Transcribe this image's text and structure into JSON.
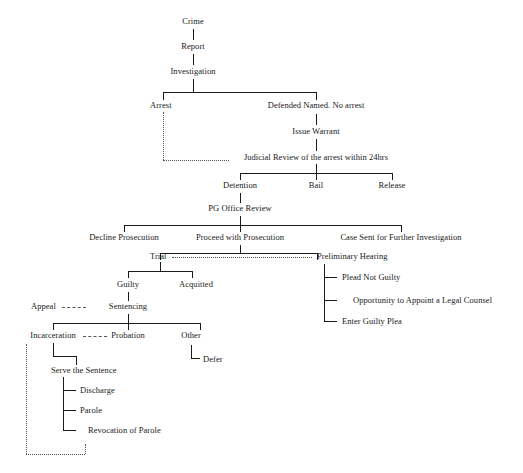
{
  "diagram": {
    "background_color": "#ffffff",
    "line_color": "#1a1a1a",
    "dotted_line_color": "#555555",
    "nodes": {
      "crime": "Crime",
      "report": "Report",
      "investigation": "Investigation",
      "arrest": "Arrest",
      "defended_named": "Defended Named. No arrest",
      "issue_warrant": "Issue Warrant",
      "judicial_review": "Judicial Review of the arrest within 24hrs",
      "detention": "Detention",
      "bail": "Bail",
      "release": "Release",
      "pg_office_review": "PG Office Review",
      "decline_prosecution": "Decline Prosecution",
      "proceed_with_prosecution": "Proceed with Prosecution",
      "case_sent_further": "Case Sent for Further Investigation",
      "trial": "Trial",
      "preliminary_hearing": "Preliminary Hearing",
      "guilty": "Guilty",
      "acquitted": "Acquitted",
      "appeal": "Appeal",
      "sentencing": "Sentencing",
      "incarceration": "Incarceration",
      "probation": "Probation",
      "other": "Other",
      "defer": "Defer",
      "serve_the_sentence": "Serve the Sentence",
      "discharge": "Discharge",
      "parole": "Parole",
      "revocation_of_parole": "Revocation of Parole",
      "plead_not_guilty": "Plead Not Guilty",
      "opportunity_counsel": "Opportunity to Appoint a Legal Counsel",
      "enter_guilty_plea": "Enter Guilty Plea"
    }
  }
}
